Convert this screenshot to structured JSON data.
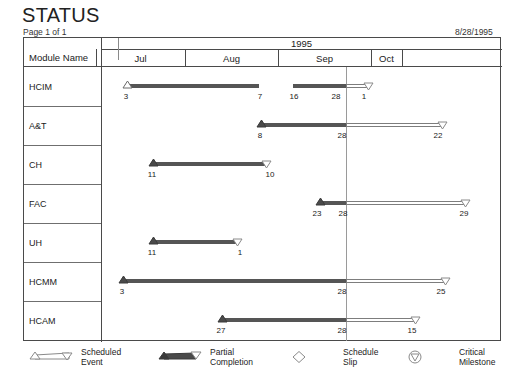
{
  "header": {
    "title": "STATUS",
    "page_label": "Page 1 of 1",
    "date": "8/28/1995"
  },
  "table": {
    "module_column_header": "Module Name",
    "year_header": "1995",
    "months": [
      {
        "label": "Jul",
        "left": 95,
        "width": 89
      },
      {
        "label": "Aug",
        "left": 184,
        "width": 93
      },
      {
        "label": "Sep",
        "left": 277,
        "width": 93
      },
      {
        "label": "Oct",
        "left": 370,
        "width": 31
      }
    ]
  },
  "today_marker": {
    "x": 345,
    "label": "8/28/1995"
  },
  "chart_data": {
    "type": "gantt",
    "title": "STATUS",
    "xlabel": "",
    "ylabel": "Module Name",
    "axis_year": "1995",
    "axis_months": [
      "Jul",
      "Aug",
      "Sep",
      "Oct"
    ],
    "today_line_date": "Aug 28",
    "legend_position": "bottom",
    "grid": false,
    "rows": [
      {
        "name": "HCIM",
        "segments": [
          {
            "kind": "done",
            "start_x": 124,
            "end_x": 258,
            "start_marker": "triangle-up-open",
            "end_marker": "none"
          },
          {
            "kind": "done",
            "start_x": 292,
            "end_x": 345,
            "start_marker": "none",
            "end_marker": "none"
          },
          {
            "kind": "open",
            "start_x": 345,
            "end_x": 368,
            "start_marker": "none",
            "end_marker": "triangle-down-open"
          }
        ],
        "date_labels": [
          {
            "text": "3",
            "x": 124
          },
          {
            "text": "7",
            "x": 258
          },
          {
            "text": "16",
            "x": 292
          },
          {
            "text": "28",
            "x": 334
          },
          {
            "text": "1",
            "x": 362
          }
        ]
      },
      {
        "name": "A&T",
        "segments": [
          {
            "kind": "done",
            "start_x": 258,
            "end_x": 345,
            "start_marker": "triangle-up-solid",
            "end_marker": "none"
          },
          {
            "kind": "open",
            "start_x": 345,
            "end_x": 442,
            "start_marker": "none",
            "end_marker": "triangle-down-open"
          }
        ],
        "date_labels": [
          {
            "text": "8",
            "x": 258
          },
          {
            "text": "28",
            "x": 340
          },
          {
            "text": "22",
            "x": 436
          }
        ]
      },
      {
        "name": "CH",
        "segments": [
          {
            "kind": "done",
            "start_x": 150,
            "end_x": 266,
            "start_marker": "triangle-up-solid",
            "end_marker": "triangle-down-open"
          }
        ],
        "date_labels": [
          {
            "text": "11",
            "x": 150
          },
          {
            "text": "10",
            "x": 268
          }
        ]
      },
      {
        "name": "FAC",
        "segments": [
          {
            "kind": "done",
            "start_x": 317,
            "end_x": 345,
            "start_marker": "triangle-up-solid",
            "end_marker": "none"
          },
          {
            "kind": "open",
            "start_x": 345,
            "end_x": 465,
            "start_marker": "none",
            "end_marker": "triangle-down-open"
          }
        ],
        "date_labels": [
          {
            "text": "23",
            "x": 315
          },
          {
            "text": "28",
            "x": 341
          },
          {
            "text": "29",
            "x": 462
          }
        ]
      },
      {
        "name": "UH",
        "segments": [
          {
            "kind": "done",
            "start_x": 150,
            "end_x": 237,
            "start_marker": "triangle-up-solid",
            "end_marker": "triangle-down-open"
          }
        ],
        "date_labels": [
          {
            "text": "11",
            "x": 150
          },
          {
            "text": "1",
            "x": 238
          }
        ]
      },
      {
        "name": "HCMM",
        "segments": [
          {
            "kind": "done",
            "start_x": 120,
            "end_x": 345,
            "start_marker": "triangle-up-solid",
            "end_marker": "none"
          },
          {
            "kind": "open",
            "start_x": 345,
            "end_x": 445,
            "start_marker": "none",
            "end_marker": "triangle-down-open"
          }
        ],
        "date_labels": [
          {
            "text": "3",
            "x": 120
          },
          {
            "text": "28",
            "x": 340
          },
          {
            "text": "25",
            "x": 439
          }
        ]
      },
      {
        "name": "HCAM",
        "segments": [
          {
            "kind": "done",
            "start_x": 219,
            "end_x": 345,
            "start_marker": "triangle-up-solid",
            "end_marker": "none"
          },
          {
            "kind": "open",
            "start_x": 345,
            "end_x": 415,
            "start_marker": "none",
            "end_marker": "triangle-down-open"
          }
        ],
        "date_labels": [
          {
            "text": "27",
            "x": 219
          },
          {
            "text": "28",
            "x": 340
          },
          {
            "text": "15",
            "x": 410
          }
        ]
      }
    ]
  },
  "legend": {
    "items": [
      {
        "glyph": "scheduled-event",
        "line1": "Scheduled",
        "line2": "Event",
        "left": 6
      },
      {
        "glyph": "partial-completion",
        "line1": "Partial",
        "line2": "Completion",
        "left": 135
      },
      {
        "glyph": "schedule-slip",
        "line1": "Schedule",
        "line2": "Slip",
        "left": 268
      },
      {
        "glyph": "critical-milestone",
        "line1": "Critical",
        "line2": "Milestone",
        "left": 384
      }
    ]
  },
  "colors": {
    "bar_done": "#555555",
    "bar_open_border": "#7d7d7d",
    "frame": "#4a4a4a",
    "today_line": "#9a9a9a",
    "text": "#222222"
  }
}
